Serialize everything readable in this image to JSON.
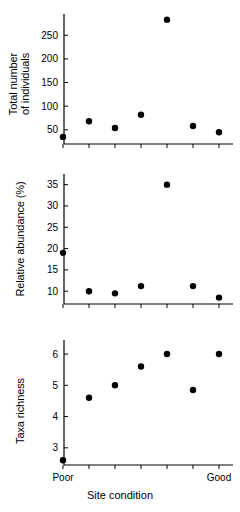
{
  "figure": {
    "type": "multi-panel-scatter",
    "panel_count": 3,
    "x_axis_title": "Site condition",
    "x_category_labels": [
      "Poor",
      "Good"
    ],
    "x_tick_count": 7,
    "marker_color": "#000000",
    "axis_color": "#000000",
    "background": "#ffffff"
  },
  "chart_data": [
    {
      "type": "scatter",
      "title": "",
      "xlabel": "Site condition",
      "ylabel": "Total number of individuals",
      "x": [
        1,
        2,
        3,
        4,
        5,
        6,
        7
      ],
      "values": [
        35,
        68,
        54,
        82,
        283,
        58,
        45
      ],
      "yticks": [
        50,
        100,
        150,
        200,
        250
      ],
      "ytick_labels": [
        "50",
        "100",
        "150",
        "200",
        "250"
      ],
      "ylim": [
        20,
        295
      ],
      "xlim": [
        0.5,
        7.5
      ],
      "grid": false,
      "legend": "none"
    },
    {
      "type": "scatter",
      "title": "",
      "xlabel": "Site condition",
      "ylabel": "Relative abundance (%)",
      "x": [
        1,
        2,
        3,
        4,
        5,
        6,
        7
      ],
      "values": [
        19,
        10,
        9.5,
        11.2,
        35,
        11.2,
        8.5
      ],
      "yticks": [
        10,
        15,
        20,
        25,
        30,
        35
      ],
      "ytick_labels": [
        "10",
        "15",
        "20",
        "25",
        "30",
        "35"
      ],
      "ylim": [
        7,
        37.5
      ],
      "xlim": [
        0.5,
        7.5
      ],
      "grid": false,
      "legend": "none"
    },
    {
      "type": "scatter",
      "title": "",
      "xlabel": "Site condition",
      "ylabel": "Taxa richness",
      "x": [
        1,
        2,
        3,
        4,
        5,
        6,
        7
      ],
      "values": [
        2.6,
        4.6,
        5.0,
        5.6,
        6.0,
        4.85,
        6.0
      ],
      "yticks": [
        3,
        4,
        5,
        6
      ],
      "ytick_labels": [
        "3",
        "4",
        "5",
        "6"
      ],
      "ylim": [
        2.45,
        6.45
      ],
      "xlim": [
        0.5,
        7.5
      ],
      "grid": false,
      "legend": "none",
      "x_category_labels": {
        "first": "Poor",
        "last": "Good"
      }
    }
  ]
}
